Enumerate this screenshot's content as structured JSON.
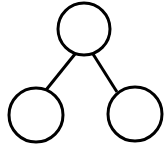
{
  "diagram": {
    "type": "tree",
    "stroke_color": "#000000",
    "fill_color": "#ffffff",
    "nodes": [
      {
        "id": "root",
        "label": "",
        "cx": 84,
        "cy": 29,
        "r": 27
      },
      {
        "id": "left-child",
        "label": "",
        "cx": 36,
        "cy": 115,
        "r": 27
      },
      {
        "id": "right-child",
        "label": "",
        "cx": 135,
        "cy": 114,
        "r": 27
      }
    ],
    "edges": [
      {
        "from": "root",
        "to": "left-child"
      },
      {
        "from": "root",
        "to": "right-child"
      }
    ]
  }
}
